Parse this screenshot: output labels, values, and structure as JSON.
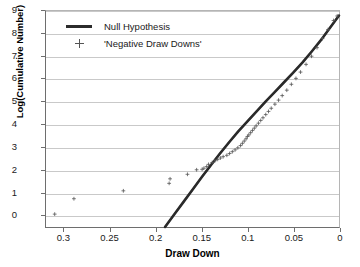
{
  "chart_data": {
    "type": "scatter",
    "title": "",
    "xlabel": "Draw Down",
    "ylabel": "Log(Cumulative Number)",
    "xlim": [
      0.32,
      0.0
    ],
    "ylim": [
      -0.55,
      9.0
    ],
    "x_reversed": true,
    "grid": true,
    "legend_position": "top-left",
    "xticks": [
      "0.3",
      "0.25",
      "0.2",
      "0.15",
      "0.1",
      "0.05",
      "0"
    ],
    "xtick_values": [
      0.3,
      0.25,
      0.2,
      0.15,
      0.1,
      0.05,
      0.0
    ],
    "yticks": [
      "0",
      "1",
      "2",
      "3",
      "4",
      "5",
      "6",
      "7",
      "8",
      "9"
    ],
    "ytick_values": [
      0,
      1,
      2,
      3,
      4,
      5,
      6,
      7,
      8,
      9
    ],
    "series": [
      {
        "name": "Null Hypothesis",
        "type": "line",
        "color": "#2b2b2b",
        "x": [
          0.19,
          0.18,
          0.17,
          0.16,
          0.15,
          0.14,
          0.13,
          0.12,
          0.11,
          0.1,
          0.09,
          0.08,
          0.07,
          0.06,
          0.05,
          0.04,
          0.03,
          0.02,
          0.01,
          0.0
        ],
        "y": [
          -0.55,
          0.0,
          0.55,
          1.1,
          1.65,
          2.18,
          2.7,
          3.2,
          3.68,
          4.12,
          4.56,
          5.0,
          5.42,
          5.85,
          6.28,
          6.72,
          7.2,
          7.7,
          8.25,
          8.8
        ]
      },
      {
        "name": "'Negative Draw Downs'",
        "type": "scatter",
        "marker": "plus",
        "color": "#555555",
        "x": [
          0.3105,
          0.2895,
          0.2355,
          0.1855,
          0.1845,
          0.1655,
          0.1555,
          0.1495,
          0.1475,
          0.1445,
          0.1425,
          0.1385,
          0.1355,
          0.1325,
          0.1295,
          0.1265,
          0.1225,
          0.1195,
          0.1165,
          0.1135,
          0.1105,
          0.1075,
          0.1055,
          0.1035,
          0.1015,
          0.1,
          0.0985,
          0.0965,
          0.0945,
          0.0925,
          0.0905,
          0.088,
          0.0855,
          0.083,
          0.08,
          0.077,
          0.074,
          0.07,
          0.066,
          0.062,
          0.057,
          0.052,
          0.047,
          0.042,
          0.036,
          0.03,
          0.024,
          0.018,
          0.012,
          0.006,
          0.002
        ],
        "y": [
          0.02,
          0.7,
          1.05,
          1.38,
          1.58,
          1.78,
          1.98,
          2.0,
          2.05,
          2.12,
          2.22,
          2.3,
          2.38,
          2.44,
          2.5,
          2.56,
          2.62,
          2.7,
          2.78,
          2.86,
          2.95,
          3.05,
          3.15,
          3.25,
          3.35,
          3.45,
          3.52,
          3.62,
          3.72,
          3.82,
          3.92,
          4.04,
          4.16,
          4.28,
          4.42,
          4.56,
          4.7,
          4.88,
          5.06,
          5.26,
          5.5,
          5.76,
          6.02,
          6.3,
          6.64,
          7.0,
          7.38,
          7.78,
          8.18,
          8.58,
          8.78
        ]
      }
    ]
  },
  "legend": {
    "items": [
      {
        "label": "Null Hypothesis",
        "key": "line-swatch"
      },
      {
        "label": "'Negative Draw Downs'",
        "key": "plus-swatch"
      }
    ]
  },
  "colors": {
    "line": "#2b2b2b",
    "marker": "#555555",
    "grid": "#c9c9c9",
    "axis": "#6e6e6e",
    "background": "#ffffff",
    "text": "#1a1a1a"
  }
}
